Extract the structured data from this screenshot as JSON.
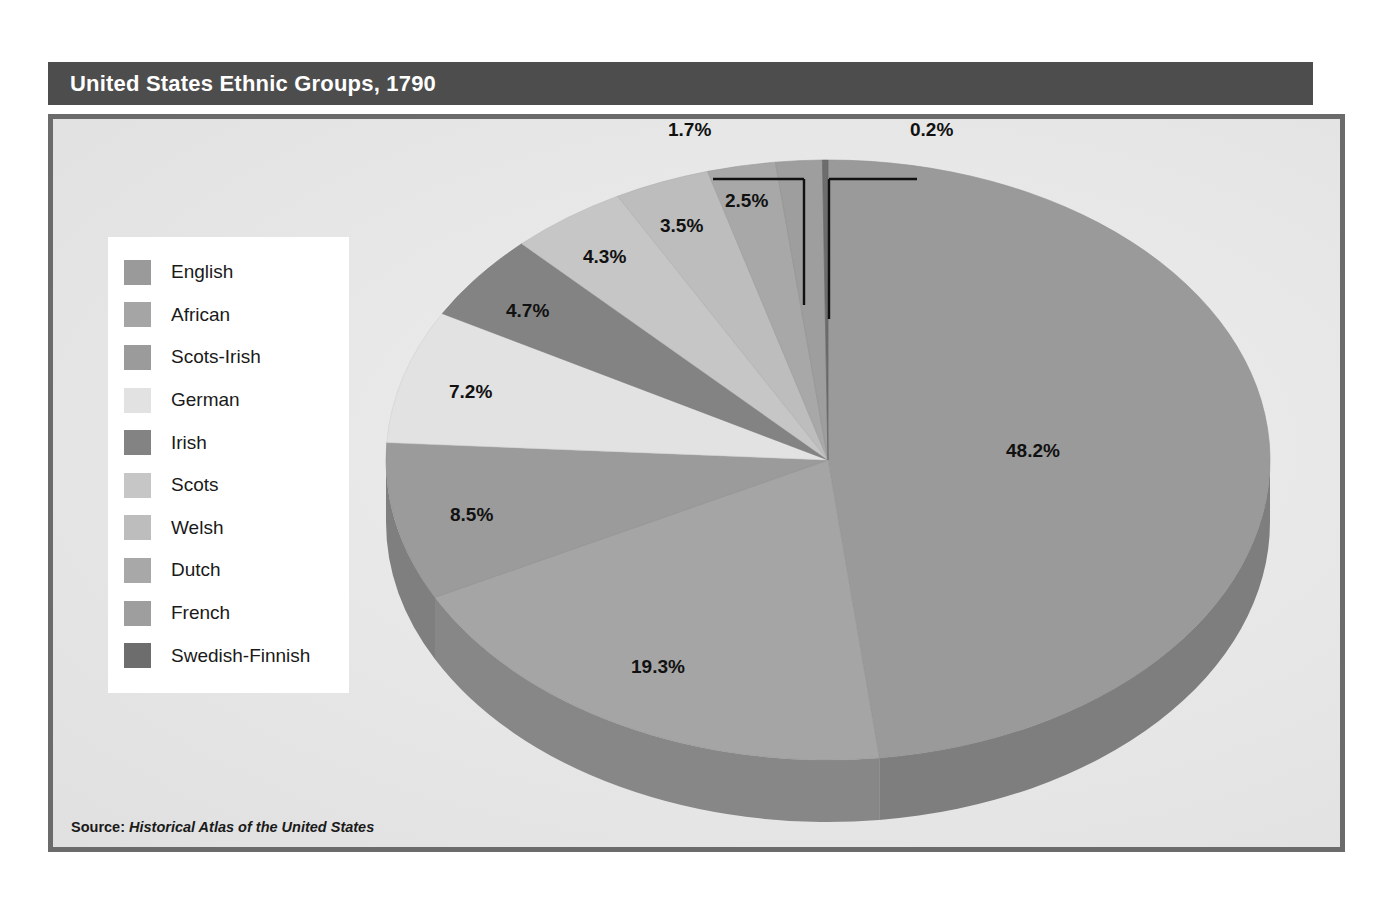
{
  "header": {
    "title": "United States Ethnic Groups, 1790"
  },
  "source": {
    "prefix": "Source:",
    "title": "Historical Atlas of the United States"
  },
  "legend": {
    "items": [
      {
        "label": "English",
        "color": "#9a9a9a"
      },
      {
        "label": "African",
        "color": "#a5a5a5"
      },
      {
        "label": "Scots-Irish",
        "color": "#9b9b9b"
      },
      {
        "label": "German",
        "color": "#e2e2e2"
      },
      {
        "label": "Irish",
        "color": "#838383"
      },
      {
        "label": "Scots",
        "color": "#c6c6c6"
      },
      {
        "label": "Welsh",
        "color": "#bdbdbd"
      },
      {
        "label": "Dutch",
        "color": "#a8a8a8"
      },
      {
        "label": "French",
        "color": "#9e9e9e"
      },
      {
        "label": "Swedish-Finnish",
        "color": "#6d6d6d"
      }
    ]
  },
  "chart_data": {
    "type": "pie",
    "title": "United States Ethnic Groups, 1790",
    "subtitle": "",
    "xlabel": "",
    "ylabel": "",
    "unit": "percent",
    "three_d": true,
    "legend_position": "left",
    "grid": false,
    "categories": [
      "English",
      "African",
      "Scots-Irish",
      "German",
      "Irish",
      "Scots",
      "Welsh",
      "Dutch",
      "French",
      "Swedish-Finnish"
    ],
    "values": [
      48.2,
      19.3,
      8.5,
      7.2,
      4.7,
      4.3,
      3.5,
      2.5,
      1.7,
      0.2
    ],
    "labels": [
      "48.2%",
      "19.3%",
      "8.5%",
      "7.2%",
      "4.7%",
      "4.3%",
      "3.5%",
      "2.5%",
      "1.7%",
      "0.2%"
    ],
    "colors": [
      "#9a9a9a",
      "#a5a5a5",
      "#9b9b9b",
      "#e2e2e2",
      "#838383",
      "#c6c6c6",
      "#bdbdbd",
      "#a8a8a8",
      "#9e9e9e",
      "#6d6d6d"
    ],
    "slices": [
      {
        "name": "English",
        "value": 48.2,
        "label": "48.2%",
        "color": "#9a9a9a",
        "callout": false
      },
      {
        "name": "African",
        "value": 19.3,
        "label": "19.3%",
        "color": "#a5a5a5",
        "callout": false
      },
      {
        "name": "Scots-Irish",
        "value": 8.5,
        "label": "8.5%",
        "color": "#9b9b9b",
        "callout": false
      },
      {
        "name": "German",
        "value": 7.2,
        "label": "7.2%",
        "color": "#e2e2e2",
        "callout": false
      },
      {
        "name": "Irish",
        "value": 4.7,
        "label": "4.7%",
        "color": "#838383",
        "callout": false
      },
      {
        "name": "Scots",
        "value": 4.3,
        "label": "4.3%",
        "color": "#c6c6c6",
        "callout": false
      },
      {
        "name": "Welsh",
        "value": 3.5,
        "label": "3.5%",
        "color": "#bdbdbd",
        "callout": false
      },
      {
        "name": "Dutch",
        "value": 2.5,
        "label": "2.5%",
        "color": "#a8a8a8",
        "callout": false
      },
      {
        "name": "French",
        "value": 1.7,
        "label": "1.7%",
        "color": "#9e9e9e",
        "callout": true
      },
      {
        "name": "Swedish-Finnish",
        "value": 0.2,
        "label": "0.2%",
        "color": "#6d6d6d",
        "callout": true
      }
    ],
    "total": 100.1
  },
  "percent_labels": [
    {
      "key": "english",
      "text": "48.2%",
      "x": 1006,
      "y": 449
    },
    {
      "key": "african",
      "text": "19.3%",
      "x": 631,
      "y": 665
    },
    {
      "key": "scots-irish",
      "text": "8.5%",
      "x": 450,
      "y": 513
    },
    {
      "key": "german",
      "text": "7.2%",
      "x": 449,
      "y": 390
    },
    {
      "key": "irish",
      "text": "4.7%",
      "x": 506,
      "y": 309
    },
    {
      "key": "scots",
      "text": "4.3%",
      "x": 583,
      "y": 255
    },
    {
      "key": "welsh",
      "text": "3.5%",
      "x": 660,
      "y": 224
    },
    {
      "key": "dutch",
      "text": "2.5%",
      "x": 725,
      "y": 199
    },
    {
      "key": "french",
      "text": "1.7%",
      "x": 668,
      "y": 128
    },
    {
      "key": "swedish-finnish",
      "text": "0.2%",
      "x": 910,
      "y": 128
    }
  ],
  "colors": {
    "title_bar_bg": "#4d4d4d",
    "title_text": "#ffffff",
    "panel_border": "#6b6b6b",
    "panel_bg": "#e9e9e9",
    "legend_bg": "#ffffff",
    "text": "#1a1a1a",
    "callout_line": "#111111",
    "page_bg": "#ffffff"
  }
}
